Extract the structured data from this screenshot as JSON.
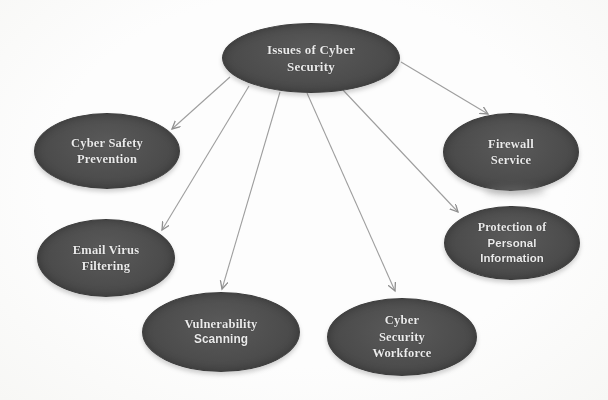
{
  "figure": {
    "type": "concept-map"
  },
  "colors": {
    "background": "#fcfcfc",
    "node_fill": "#4d4d4d",
    "node_border": "#3c3c3c",
    "node_text": "#ebebeb",
    "arrow": "#9e9e9e"
  },
  "nodes": [
    {
      "id": "issues-of-cyber-security",
      "role": "root",
      "lines": [
        "Issues of Cyber",
        "Security"
      ]
    },
    {
      "id": "cyber-safety-prevention",
      "role": "branch",
      "lines": [
        "Cyber Safety",
        "Prevention"
      ]
    },
    {
      "id": "email-virus-filtering",
      "role": "branch",
      "lines": [
        "Email Virus",
        "Filtering"
      ]
    },
    {
      "id": "vulnerability-scanning",
      "role": "branch",
      "lines": [
        "Vulnerability",
        "Scanning"
      ]
    },
    {
      "id": "cyber-security-workforce",
      "role": "branch",
      "lines": [
        "Cyber",
        "Security",
        "Workforce"
      ]
    },
    {
      "id": "protection-of-personal-information",
      "role": "branch",
      "lines": [
        "Protection of",
        "Personal",
        "Information"
      ]
    },
    {
      "id": "firewall-service",
      "role": "branch",
      "lines": [
        "Firewall",
        "Service"
      ]
    }
  ],
  "edges": [
    {
      "from": "issues-of-cyber-security",
      "to": "cyber-safety-prevention"
    },
    {
      "from": "issues-of-cyber-security",
      "to": "email-virus-filtering"
    },
    {
      "from": "issues-of-cyber-security",
      "to": "vulnerability-scanning"
    },
    {
      "from": "issues-of-cyber-security",
      "to": "cyber-security-workforce"
    },
    {
      "from": "issues-of-cyber-security",
      "to": "protection-of-personal-information"
    },
    {
      "from": "issues-of-cyber-security",
      "to": "firewall-service"
    }
  ]
}
